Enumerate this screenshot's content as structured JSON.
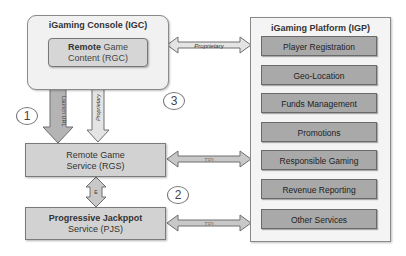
{
  "console": {
    "title": "iGaming Console (IGC)",
    "rgc_line1_bold": "Remote",
    "rgc_line1_rest": " Game",
    "rgc_line2": "Content (RGC)"
  },
  "rgs": {
    "line1": "Remote Game",
    "line2": "Service (RGS)"
  },
  "pjs": {
    "line1": "Progressive Jackppot",
    "line2": "Service (PJS)"
  },
  "platform": {
    "title": "iGaming Platform (IGP)",
    "services": [
      "Player Registration",
      "Geo-Location",
      "Funds Management",
      "Promotions",
      "Responsible Gaming",
      "Revenue Reporting",
      "Other Services"
    ]
  },
  "arrows": {
    "igc_igp": "Proprietary",
    "rgc_rgs": "Proprietary",
    "launch_url": "Launch URL",
    "rgs_igp": "TPI",
    "pjs_igp": "TPI",
    "rgs_pjs": "E",
    "igc_e": "E"
  },
  "markers": {
    "one": "1",
    "two": "2",
    "three": "3"
  },
  "colors": {
    "arrow_fill": "#c8c8c8",
    "arrow_stroke": "#6e6e6e",
    "service_fill": "#a9a9a9",
    "box_fill": "#d2d2d2"
  }
}
